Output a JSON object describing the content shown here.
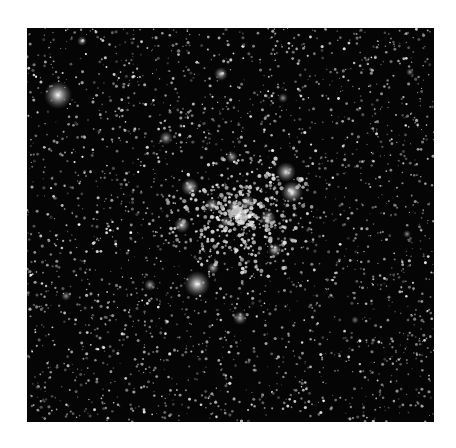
{
  "image": {
    "subject": "star cluster field",
    "background_color": "#050505",
    "page_background": "#ffffff",
    "field": {
      "x": 27,
      "y": 28,
      "width": 407,
      "height": 394
    },
    "faint_star_count": 2600,
    "bright_stars": [
      {
        "x": 58,
        "y": 95,
        "r": 14,
        "b": 1.0
      },
      {
        "x": 82,
        "y": 41,
        "r": 5,
        "b": 0.7
      },
      {
        "x": 221,
        "y": 74,
        "r": 7,
        "b": 0.8
      },
      {
        "x": 283,
        "y": 98,
        "r": 5,
        "b": 0.6
      },
      {
        "x": 166,
        "y": 138,
        "r": 7,
        "b": 0.7
      },
      {
        "x": 232,
        "y": 157,
        "r": 6,
        "b": 0.7
      },
      {
        "x": 286,
        "y": 172,
        "r": 10,
        "b": 0.9
      },
      {
        "x": 292,
        "y": 192,
        "r": 11,
        "b": 0.95
      },
      {
        "x": 190,
        "y": 187,
        "r": 9,
        "b": 0.9
      },
      {
        "x": 212,
        "y": 205,
        "r": 7,
        "b": 0.8
      },
      {
        "x": 235,
        "y": 207,
        "r": 8,
        "b": 0.85
      },
      {
        "x": 248,
        "y": 202,
        "r": 7,
        "b": 0.8
      },
      {
        "x": 268,
        "y": 218,
        "r": 8,
        "b": 0.8
      },
      {
        "x": 182,
        "y": 225,
        "r": 8,
        "b": 0.85
      },
      {
        "x": 226,
        "y": 222,
        "r": 6,
        "b": 0.7
      },
      {
        "x": 275,
        "y": 250,
        "r": 7,
        "b": 0.8
      },
      {
        "x": 213,
        "y": 268,
        "r": 6,
        "b": 0.75
      },
      {
        "x": 197,
        "y": 284,
        "r": 13,
        "b": 1.0
      },
      {
        "x": 150,
        "y": 285,
        "r": 6,
        "b": 0.7
      },
      {
        "x": 66,
        "y": 296,
        "r": 5,
        "b": 0.6
      },
      {
        "x": 240,
        "y": 318,
        "r": 7,
        "b": 0.75
      },
      {
        "x": 410,
        "y": 72,
        "r": 4,
        "b": 0.6
      },
      {
        "x": 407,
        "y": 234,
        "r": 4,
        "b": 0.6
      },
      {
        "x": 355,
        "y": 320,
        "r": 4,
        "b": 0.5
      }
    ]
  }
}
